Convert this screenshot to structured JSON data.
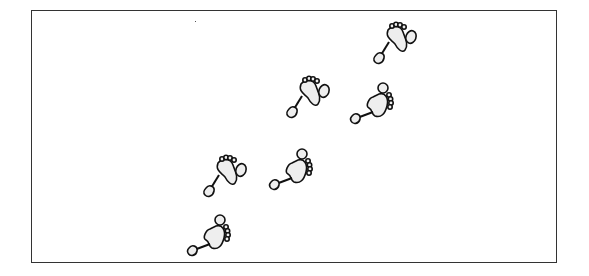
{
  "canvas": {
    "width": 589,
    "height": 276,
    "frame_color": "#333333",
    "background": "#ffffff"
  },
  "footprints": {
    "fill_color": "#eeeeee",
    "stroke_color": "#111111",
    "count": 6,
    "items": [
      {
        "id": 1,
        "variant": "toes-up",
        "x": 365,
        "y": 18
      },
      {
        "id": 2,
        "variant": "toes-up",
        "x": 278,
        "y": 72
      },
      {
        "id": 3,
        "variant": "toes-right",
        "x": 343,
        "y": 78
      },
      {
        "id": 4,
        "variant": "toes-up",
        "x": 195,
        "y": 151
      },
      {
        "id": 5,
        "variant": "toes-right",
        "x": 262,
        "y": 144
      },
      {
        "id": 6,
        "variant": "toes-right",
        "x": 180,
        "y": 210
      }
    ]
  }
}
